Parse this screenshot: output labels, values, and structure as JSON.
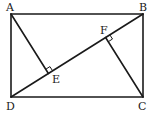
{
  "diagram": {
    "type": "geometry",
    "stroke_color": "#1a1a1a",
    "points": {
      "A": {
        "label": "A",
        "x": 11,
        "y": 14
      },
      "B": {
        "label": "B",
        "x": 143,
        "y": 14
      },
      "C": {
        "label": "C",
        "x": 143,
        "y": 97
      },
      "D": {
        "label": "D",
        "x": 11,
        "y": 97
      },
      "E": {
        "label": "E",
        "x": 48.4,
        "y": 73.5
      },
      "F": {
        "label": "F",
        "x": 105.6,
        "y": 37.5
      }
    },
    "segments": [
      "AB",
      "BC",
      "CD",
      "DA",
      "BD",
      "AE",
      "CF"
    ],
    "right_angles": [
      "AEB",
      "CFD"
    ]
  }
}
